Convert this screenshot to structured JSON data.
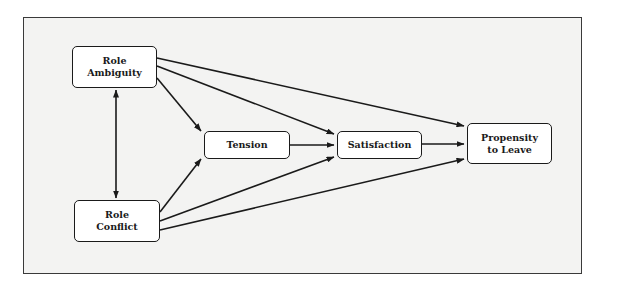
{
  "diagram": {
    "type": "path-model",
    "nodes": [
      {
        "id": "role_ambiguity",
        "lines": [
          "Role",
          "Ambiguity"
        ],
        "x": 72,
        "y": 46,
        "w": 85,
        "h": 42
      },
      {
        "id": "role_conflict",
        "lines": [
          "Role",
          "Conflict"
        ],
        "x": 74,
        "y": 200,
        "w": 86,
        "h": 42
      },
      {
        "id": "tension",
        "lines": [
          "Tension"
        ],
        "x": 204,
        "y": 131,
        "w": 86,
        "h": 28
      },
      {
        "id": "satisfaction",
        "lines": [
          "Satisfaction"
        ],
        "x": 337,
        "y": 131,
        "w": 85,
        "h": 28
      },
      {
        "id": "propensity_to_leave",
        "lines": [
          "Propensity",
          "to Leave"
        ],
        "x": 467,
        "y": 123,
        "w": 85,
        "h": 41
      }
    ],
    "edges": [
      {
        "from": "role_ambiguity",
        "to": "role_conflict",
        "bidirectional": true
      },
      {
        "from": "role_ambiguity",
        "to": "tension"
      },
      {
        "from": "role_ambiguity",
        "to": "satisfaction"
      },
      {
        "from": "role_ambiguity",
        "to": "propensity_to_leave"
      },
      {
        "from": "role_conflict",
        "to": "tension"
      },
      {
        "from": "role_conflict",
        "to": "satisfaction"
      },
      {
        "from": "role_conflict",
        "to": "propensity_to_leave"
      },
      {
        "from": "tension",
        "to": "satisfaction"
      },
      {
        "from": "satisfaction",
        "to": "propensity_to_leave"
      }
    ]
  },
  "labels": {
    "role_ambiguity_1": "Role",
    "role_ambiguity_2": "Ambiguity",
    "role_conflict_1": "Role",
    "role_conflict_2": "Conflict",
    "tension": "Tension",
    "satisfaction": "Satisfaction",
    "propensity_1": "Propensity",
    "propensity_2": "to Leave"
  },
  "colors": {
    "stroke": "#1a1a1a",
    "frame_background": "#f3f3f2",
    "node_fill": "#ffffff"
  }
}
